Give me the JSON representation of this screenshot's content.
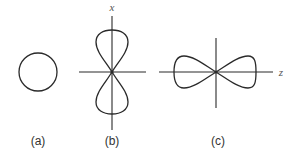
{
  "figure": {
    "panels": [
      {
        "id": "a",
        "label": "(a)",
        "shape": "circle"
      },
      {
        "id": "b",
        "label": "(b)",
        "shape": "figure-eight-vertical",
        "axis_label": "x"
      },
      {
        "id": "c",
        "label": "(c)",
        "shape": "figure-eight-horizontal",
        "axis_label": "z"
      }
    ]
  }
}
